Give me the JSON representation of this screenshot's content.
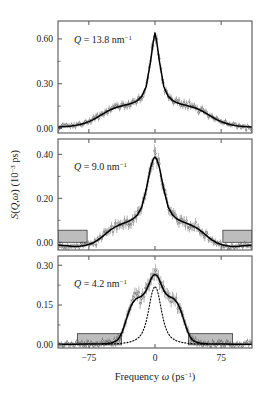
{
  "figure": {
    "xaxis": {
      "label_parts": {
        "pre": "Frequency ",
        "sym": "ω",
        "unit": " (ps",
        "sup": "−1",
        "post": ")"
      },
      "ticks": [
        "−75",
        "0",
        "75"
      ],
      "tick_values": [
        -75,
        0,
        75
      ],
      "min": -110,
      "max": 110
    },
    "yaxis": {
      "label_parts": {
        "s": "S",
        "paren_open": "(",
        "q": "Q",
        "comma": ",",
        "w": "ω",
        "paren_close": ")",
        "unit": " (10",
        "sup": "−3",
        "post": " ps)"
      }
    },
    "colors": {
      "axis": "#555555",
      "data": "#2b2b2b",
      "fit": "#000000",
      "shade_fill": "#bdbdbd",
      "shade_stroke": "#3a3a3a",
      "background": "#ffffff"
    }
  },
  "chart_data": [
    {
      "type": "line",
      "panel": 1,
      "title": "",
      "annotation": {
        "pre": "Q",
        "eq": " = ",
        "value": "13.8",
        "unit": " nm",
        "sup": "−1"
      },
      "q_value": 13.8,
      "q_unit": "nm^-1",
      "xlabel": "Frequency ω (ps−1)",
      "ylabel": "S(Q,ω) (10−3 ps)",
      "xlim": [
        -110,
        110
      ],
      "ylim": [
        -0.03,
        0.72
      ],
      "yticks": [
        0.0,
        0.3,
        0.6
      ],
      "ytick_labels": [
        "0.00",
        "0.30",
        "0.60"
      ],
      "grid": false,
      "legend": "none",
      "peak_value": 0.64,
      "series": [
        {
          "name": "fit",
          "style": "solid",
          "x": [
            -110,
            -105,
            -100,
            -95,
            -90,
            -85,
            -80,
            -75,
            -70,
            -65,
            -60,
            -55,
            -50,
            -45,
            -40,
            -35,
            -30,
            -25,
            -20,
            -15,
            -10,
            -5,
            -2,
            0,
            2,
            5,
            10,
            15,
            20,
            25,
            30,
            35,
            40,
            45,
            50,
            55,
            60,
            65,
            70,
            75,
            80,
            85,
            90,
            95,
            100,
            105,
            110
          ],
          "y": [
            0.01,
            0.012,
            0.014,
            0.017,
            0.021,
            0.027,
            0.035,
            0.046,
            0.06,
            0.077,
            0.095,
            0.112,
            0.127,
            0.139,
            0.148,
            0.156,
            0.163,
            0.172,
            0.187,
            0.215,
            0.28,
            0.45,
            0.58,
            0.64,
            0.58,
            0.45,
            0.28,
            0.215,
            0.187,
            0.172,
            0.163,
            0.156,
            0.148,
            0.139,
            0.127,
            0.112,
            0.095,
            0.077,
            0.06,
            0.046,
            0.035,
            0.027,
            0.021,
            0.017,
            0.014,
            0.012,
            0.01
          ]
        }
      ],
      "shaded_boxes": []
    },
    {
      "type": "line",
      "panel": 2,
      "annotation": {
        "pre": "Q",
        "eq": " = ",
        "value": "9.0",
        "unit": " nm",
        "sup": "−1"
      },
      "q_value": 9.0,
      "q_unit": "nm^-1",
      "xlim": [
        -110,
        110
      ],
      "ylim": [
        -0.035,
        0.47
      ],
      "yticks": [
        0.0,
        0.2,
        0.4
      ],
      "ytick_labels": [
        "0.00",
        "0.20",
        "0.40"
      ],
      "grid": false,
      "legend": "none",
      "peak_value": 0.395,
      "series": [
        {
          "name": "fit",
          "style": "solid",
          "x": [
            -110,
            -105,
            -100,
            -95,
            -90,
            -85,
            -80,
            -75,
            -70,
            -65,
            -60,
            -55,
            -50,
            -45,
            -40,
            -35,
            -30,
            -25,
            -20,
            -15,
            -10,
            -5,
            -2,
            0,
            2,
            5,
            10,
            15,
            20,
            25,
            30,
            35,
            40,
            45,
            50,
            55,
            60,
            65,
            70,
            75,
            80,
            85,
            90,
            95,
            100,
            105,
            110
          ],
          "y": [
            -0.012,
            -0.014,
            -0.016,
            -0.018,
            -0.019,
            -0.018,
            -0.015,
            -0.01,
            -0.002,
            0.01,
            0.025,
            0.042,
            0.058,
            0.07,
            0.08,
            0.088,
            0.096,
            0.106,
            0.124,
            0.16,
            0.24,
            0.34,
            0.378,
            0.388,
            0.378,
            0.34,
            0.24,
            0.16,
            0.124,
            0.106,
            0.096,
            0.088,
            0.08,
            0.07,
            0.058,
            0.042,
            0.025,
            0.01,
            -0.002,
            -0.01,
            -0.015,
            -0.018,
            -0.019,
            -0.018,
            -0.016,
            -0.014,
            -0.012
          ]
        }
      ],
      "shaded_boxes": [
        {
          "x0": -110,
          "x1": -77,
          "y0": 0.0,
          "y1": 0.055
        },
        {
          "x0": 77,
          "x1": 110,
          "y0": 0.0,
          "y1": 0.055
        }
      ]
    },
    {
      "type": "line",
      "panel": 3,
      "annotation": {
        "pre": "Q",
        "eq": " = ",
        "value": "4.2",
        "unit": " nm",
        "sup": "−1"
      },
      "q_value": 4.2,
      "q_unit": "nm^-1",
      "xlim": [
        -110,
        110
      ],
      "ylim": [
        -0.012,
        0.335
      ],
      "yticks": [
        0.0,
        0.15,
        0.3
      ],
      "ytick_labels": [
        "0.00",
        "0.15",
        "0.30"
      ],
      "grid": false,
      "legend": "none",
      "peak_value": 0.265,
      "series": [
        {
          "name": "fit",
          "style": "solid",
          "x": [
            -110,
            -100,
            -90,
            -80,
            -70,
            -60,
            -55,
            -50,
            -45,
            -42,
            -40,
            -37,
            -34,
            -31,
            -28,
            -25,
            -22,
            -19,
            -16,
            -13,
            -10,
            -7,
            -4,
            -2,
            0,
            2,
            4,
            7,
            10,
            13,
            16,
            19,
            22,
            25,
            28,
            31,
            34,
            37,
            40,
            42,
            45,
            50,
            55,
            60,
            70,
            80,
            90,
            100,
            110
          ],
          "y": [
            0.002,
            0.002,
            0.002,
            0.003,
            0.003,
            0.004,
            0.005,
            0.007,
            0.013,
            0.02,
            0.03,
            0.05,
            0.08,
            0.112,
            0.14,
            0.16,
            0.172,
            0.178,
            0.182,
            0.19,
            0.205,
            0.228,
            0.252,
            0.262,
            0.265,
            0.262,
            0.252,
            0.228,
            0.205,
            0.19,
            0.182,
            0.178,
            0.172,
            0.16,
            0.14,
            0.112,
            0.08,
            0.05,
            0.03,
            0.02,
            0.013,
            0.007,
            0.005,
            0.004,
            0.003,
            0.003,
            0.002,
            0.002,
            0.002
          ]
        },
        {
          "name": "central-component",
          "style": "dotted",
          "x": [
            -60,
            -50,
            -40,
            -32,
            -26,
            -22,
            -18,
            -15,
            -12,
            -10,
            -8,
            -6,
            -4,
            -2,
            0,
            2,
            4,
            6,
            8,
            10,
            12,
            15,
            18,
            22,
            26,
            32,
            40,
            50,
            60
          ],
          "y": [
            0.002,
            0.003,
            0.005,
            0.008,
            0.013,
            0.019,
            0.029,
            0.042,
            0.065,
            0.088,
            0.118,
            0.153,
            0.188,
            0.212,
            0.22,
            0.212,
            0.188,
            0.153,
            0.118,
            0.088,
            0.065,
            0.042,
            0.029,
            0.019,
            0.013,
            0.008,
            0.005,
            0.003,
            0.002
          ]
        }
      ],
      "shaded_boxes": [
        {
          "x0": -88,
          "x1": -38,
          "y0": 0.0,
          "y1": 0.042
        },
        {
          "x0": 38,
          "x1": 88,
          "y0": 0.0,
          "y1": 0.042
        }
      ]
    }
  ]
}
